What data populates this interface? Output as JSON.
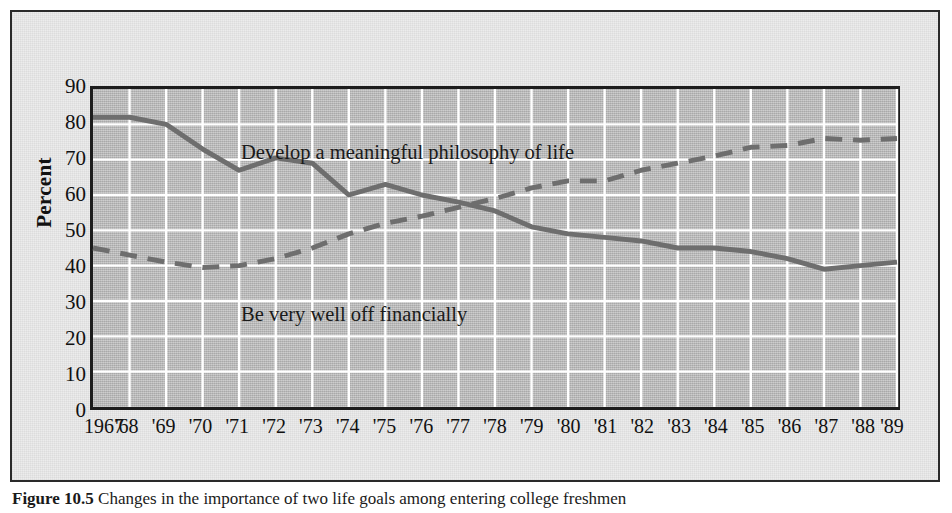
{
  "figure": {
    "caption_label": "Figure 10.5",
    "caption_text": "Changes in the importance of two life goals among entering college freshmen"
  },
  "chart_data": {
    "type": "line",
    "title": "",
    "xlabel": "",
    "ylabel": "Percent",
    "ylim": [
      0,
      90
    ],
    "ytick_step": 10,
    "yticks": [
      90,
      80,
      70,
      60,
      50,
      40,
      30,
      20,
      10,
      0
    ],
    "grid": true,
    "grid_color": "#ffffff",
    "plot_background": "#b9b9b9",
    "line_color": "#6e6e6e",
    "legend": "in-plot annotations",
    "x": [
      1967,
      1968,
      1969,
      1970,
      1971,
      1972,
      1973,
      1974,
      1975,
      1976,
      1977,
      1978,
      1979,
      1980,
      1981,
      1982,
      1983,
      1984,
      1985,
      1986,
      1987,
      1988,
      1989
    ],
    "categories": [
      "1967",
      "'68",
      "'69",
      "'70",
      "'71",
      "'72",
      "'73",
      "'74",
      "'75",
      "'76",
      "'77",
      "'78",
      "'79",
      "'80",
      "'81",
      "'82",
      "'83",
      "'84",
      "'85",
      "'86",
      "'87",
      "'88",
      "'89"
    ],
    "series": [
      {
        "name": "Develop a meaningful philosophy of life",
        "style": "solid",
        "values": [
          82,
          82,
          80,
          73,
          67,
          70.5,
          69,
          60,
          63,
          60,
          58,
          55.5,
          51,
          49,
          48,
          47,
          45,
          45,
          44,
          42,
          39,
          40,
          41
        ]
      },
      {
        "name": "Be very well off financially",
        "style": "dashed",
        "values": [
          45,
          43,
          41,
          39.5,
          40,
          42,
          45,
          49,
          52,
          54,
          56.5,
          59,
          62,
          64,
          64,
          67,
          69,
          71,
          73.5,
          74,
          76,
          75.5,
          76
        ]
      }
    ],
    "annotations": [
      {
        "text": "Develop a meaningful philosophy of life",
        "series": "Develop a meaningful philosophy of life"
      },
      {
        "text": "Be very well off financially",
        "series": "Be very well off financially"
      }
    ]
  }
}
